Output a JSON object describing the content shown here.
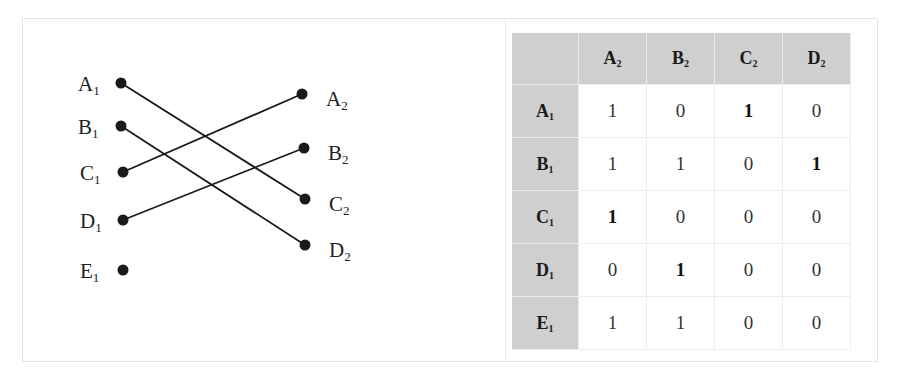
{
  "graph": {
    "left_nodes": [
      {
        "id": "A1",
        "letter": "A",
        "sub": "1",
        "x": 121,
        "y": 83
      },
      {
        "id": "B1",
        "letter": "B",
        "sub": "1",
        "x": 121,
        "y": 126
      },
      {
        "id": "C1",
        "letter": "C",
        "sub": "1",
        "x": 123,
        "y": 172
      },
      {
        "id": "D1",
        "letter": "D",
        "sub": "1",
        "x": 123,
        "y": 220
      },
      {
        "id": "E1",
        "letter": "E",
        "sub": "1",
        "x": 123,
        "y": 270
      }
    ],
    "right_nodes": [
      {
        "id": "A2",
        "letter": "A",
        "sub": "2",
        "x": 302,
        "y": 94
      },
      {
        "id": "B2",
        "letter": "B",
        "sub": "2",
        "x": 304,
        "y": 148
      },
      {
        "id": "C2",
        "letter": "C",
        "sub": "2",
        "x": 305,
        "y": 199
      },
      {
        "id": "D2",
        "letter": "D",
        "sub": "2",
        "x": 305,
        "y": 245
      }
    ],
    "edges": [
      {
        "from": "A1",
        "to": "C2"
      },
      {
        "from": "B1",
        "to": "D2"
      },
      {
        "from": "C1",
        "to": "A2"
      },
      {
        "from": "D1",
        "to": "B2"
      }
    ]
  },
  "matrix": {
    "corner": "",
    "columns": [
      {
        "letter": "A",
        "sub": "2"
      },
      {
        "letter": "B",
        "sub": "2"
      },
      {
        "letter": "C",
        "sub": "2"
      },
      {
        "letter": "D",
        "sub": "2"
      }
    ],
    "rows": [
      {
        "letter": "A",
        "sub": "1",
        "cells": [
          {
            "value": "1",
            "bold": false
          },
          {
            "value": "0",
            "bold": false
          },
          {
            "value": "1",
            "bold": true
          },
          {
            "value": "0",
            "bold": false
          }
        ]
      },
      {
        "letter": "B",
        "sub": "1",
        "cells": [
          {
            "value": "1",
            "bold": false
          },
          {
            "value": "1",
            "bold": false
          },
          {
            "value": "0",
            "bold": false
          },
          {
            "value": "1",
            "bold": true
          }
        ]
      },
      {
        "letter": "C",
        "sub": "1",
        "cells": [
          {
            "value": "1",
            "bold": true
          },
          {
            "value": "0",
            "bold": false
          },
          {
            "value": "0",
            "bold": false
          },
          {
            "value": "0",
            "bold": false
          }
        ]
      },
      {
        "letter": "D",
        "sub": "1",
        "cells": [
          {
            "value": "0",
            "bold": false
          },
          {
            "value": "1",
            "bold": true
          },
          {
            "value": "0",
            "bold": false
          },
          {
            "value": "0",
            "bold": false
          }
        ]
      },
      {
        "letter": "E",
        "sub": "1",
        "cells": [
          {
            "value": "1",
            "bold": false
          },
          {
            "value": "1",
            "bold": false
          },
          {
            "value": "0",
            "bold": false
          },
          {
            "value": "0",
            "bold": false
          }
        ]
      }
    ]
  },
  "colors": {
    "header_fill": "#cfcfcf",
    "line": "#1a1a1a",
    "frame": "#e4e4e4"
  }
}
